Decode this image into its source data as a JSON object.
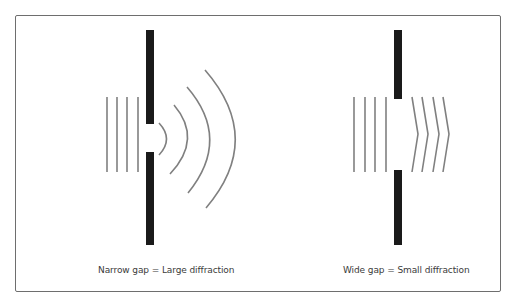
{
  "diagram": {
    "colors": {
      "barrier": "#1a1a1a",
      "wave": "#808080",
      "frame": "#6e6e6e",
      "text": "#3a3a3a"
    },
    "panels": [
      {
        "id": "narrow",
        "caption": "Narrow gap = Large diffraction",
        "barrier_x": 146,
        "barrier_width": 8,
        "barrier_top": [
          30,
          124
        ],
        "barrier_bottom": [
          152,
          245
        ],
        "incident_wave_x": [
          107,
          117,
          127,
          138
        ],
        "incident_wave_y": [
          97,
          172
        ],
        "diffracted_waves": "circular arcs",
        "arc_count": 4
      },
      {
        "id": "wide",
        "caption": "Wide gap = Small diffraction",
        "barrier_x": 394,
        "barrier_width": 8,
        "barrier_top": [
          30,
          99
        ],
        "barrier_bottom": [
          170,
          245
        ],
        "incident_wave_x": [
          354,
          365,
          375,
          386
        ],
        "incident_wave_y": [
          97,
          172
        ],
        "diffracted_waves": "shallow chevrons",
        "chevron_count": 4
      }
    ]
  }
}
